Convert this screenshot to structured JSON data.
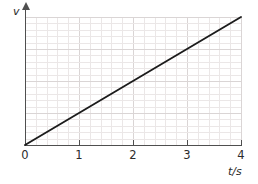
{
  "chart_data": {
    "type": "line",
    "title": "",
    "subtitle": "",
    "xlabel": "t/s",
    "ylabel": "v",
    "xlim": [
      0,
      4
    ],
    "ylim": [
      0,
      4
    ],
    "xticks": [
      "0",
      "1",
      "2",
      "3",
      "4"
    ],
    "xtick_values": [
      0,
      1,
      2,
      3,
      4
    ],
    "yticks": [],
    "grid": true,
    "grid_minor_per_unit": 5,
    "legend": "none",
    "annotations": [],
    "series": [
      {
        "name": "v(t)",
        "color": "#1c1c1c",
        "x": [
          0,
          1,
          2,
          3,
          4
        ],
        "y": [
          0,
          1,
          2,
          3,
          4
        ]
      }
    ]
  },
  "axes": {
    "y_label": "v",
    "x_label": "t/s",
    "x_tick_labels": [
      "0",
      "1",
      "2",
      "3",
      "4"
    ]
  },
  "colors": {
    "line": "#1c1c1c",
    "axis": "#4f4f4f",
    "grid_minor": "#ebe7e7",
    "grid_major": "#dad5d5",
    "text": "#2b2b2b",
    "background": "#ffffff"
  }
}
